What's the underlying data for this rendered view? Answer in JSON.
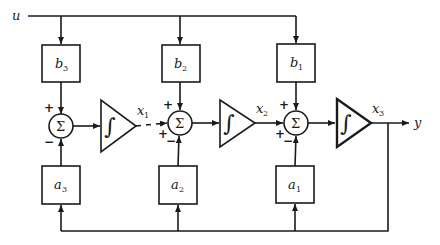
{
  "diagram": {
    "type": "block-diagram",
    "input": {
      "label": "u"
    },
    "output": {
      "label": "y"
    },
    "feedforward_gains": [
      {
        "name": "b",
        "sub": "3"
      },
      {
        "name": "b",
        "sub": "2"
      },
      {
        "name": "b",
        "sub": "1"
      }
    ],
    "feedback_gains": [
      {
        "name": "a",
        "sub": "3"
      },
      {
        "name": "a",
        "sub": "2"
      },
      {
        "name": "a",
        "sub": "1"
      }
    ],
    "summing_junctions": [
      {
        "symbol": "Σ",
        "top_sign": "+",
        "bottom_sign": "−",
        "left_sign": ""
      },
      {
        "symbol": "Σ",
        "top_sign": "+",
        "bottom_sign": "−",
        "left_sign": "+"
      },
      {
        "symbol": "Σ",
        "top_sign": "+",
        "bottom_sign": "−",
        "left_sign": "+"
      }
    ],
    "integrators": [
      {
        "symbol": "∫",
        "state": {
          "name": "x",
          "sub": "1"
        }
      },
      {
        "symbol": "∫",
        "state": {
          "name": "x",
          "sub": "2"
        }
      },
      {
        "symbol": "∫",
        "state": {
          "name": "x",
          "sub": "3"
        }
      }
    ],
    "colors": {
      "line": "#1a1a1a",
      "background": "#ffffff"
    }
  }
}
